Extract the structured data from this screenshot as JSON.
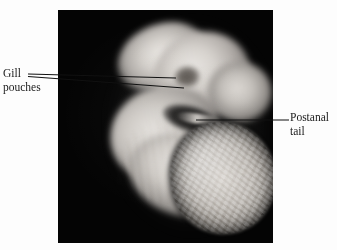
{
  "figure": {
    "kind": "labeled-photograph",
    "background_color": "#fdfdfd",
    "plate": {
      "name": "embryo-photograph",
      "background_color": "#040404",
      "subject": "vertebrate embryo specimen"
    }
  },
  "labels": {
    "gill": {
      "name": "gill-pouches-label",
      "line1": "Gill",
      "line2": "pouches",
      "text_color": "#1a1a1a",
      "leader_count": 2
    },
    "tail": {
      "name": "postanal-tail-label",
      "line1": "Postanal",
      "line2": "tail",
      "text_color": "#1a1a1a",
      "leader_count": 1
    }
  },
  "leaders": {
    "color": "#111111",
    "gill_upper": {
      "x1": 28,
      "y1": 74,
      "x2": 176,
      "y2": 78
    },
    "gill_lower": {
      "x1": 28,
      "y1": 76,
      "x2": 184,
      "y2": 88
    },
    "postanal": {
      "x1": 196,
      "y1": 120,
      "x2": 289,
      "y2": 120
    }
  }
}
